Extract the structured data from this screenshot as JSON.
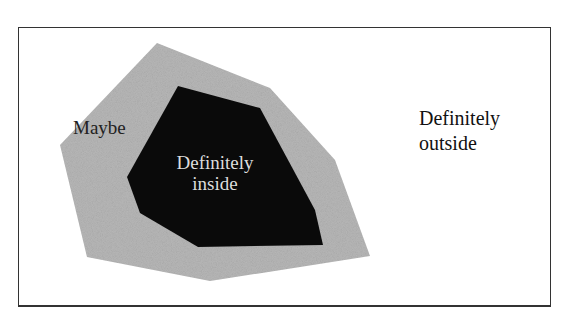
{
  "diagram": {
    "type": "nested-regions",
    "frame": {
      "border_color": "#333333",
      "background": "#ffffff"
    },
    "regions": [
      {
        "id": "maybe",
        "label": "Maybe",
        "fill": "#b8b8b8",
        "points": "157,43 270,88 335,160 370,256 210,281 87,257 60,145"
      },
      {
        "id": "inside",
        "label_lines": [
          "Definitely",
          "inside"
        ],
        "fill": "#0a0a0a",
        "text_color": "#dddddd",
        "points": "178,86 260,108 315,210 323,245 198,247 140,213 127,177"
      }
    ],
    "outside": {
      "label_lines": [
        "Definitely",
        "outside"
      ]
    }
  }
}
